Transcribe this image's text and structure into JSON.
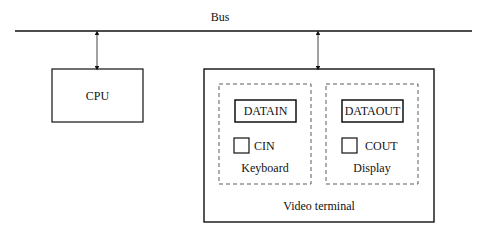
{
  "bus": {
    "label": "Bus"
  },
  "cpu": {
    "label": "CPU"
  },
  "video_terminal": {
    "label": "Video terminal",
    "keyboard": {
      "label": "Keyboard",
      "data_register": "DATAIN",
      "status_flag": "CIN"
    },
    "display": {
      "label": "Display",
      "data_register": "DATAOUT",
      "status_flag": "COUT"
    }
  }
}
